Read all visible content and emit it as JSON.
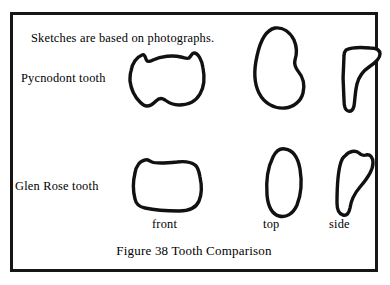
{
  "figure": {
    "caption": "Figure 38 Tooth Comparison",
    "note": "Sketches are based on photographs.",
    "border_color": "#161616",
    "background_color": "#ffffff",
    "ink_color": "#111111"
  },
  "rows": [
    {
      "label": "Pycnodont tooth"
    },
    {
      "label": "Glen Rose tooth"
    }
  ],
  "view_labels": {
    "front": "front",
    "top": "top",
    "side": "side"
  },
  "specimens": [
    {
      "name": "Pycnodont tooth",
      "views": [
        {
          "view": "front",
          "shape": "rounded-lobed-outline-with-cusp-notches"
        },
        {
          "view": "top",
          "shape": "asymmetric-teardrop-oval"
        },
        {
          "view": "side",
          "shape": "angular-boot-profile"
        }
      ]
    },
    {
      "name": "Glen Rose tooth",
      "views": [
        {
          "view": "front",
          "shape": "rounded-square-outline"
        },
        {
          "view": "top",
          "shape": "narrow-vertical-oval"
        },
        {
          "view": "side",
          "shape": "tapered-hook-profile"
        }
      ]
    }
  ]
}
